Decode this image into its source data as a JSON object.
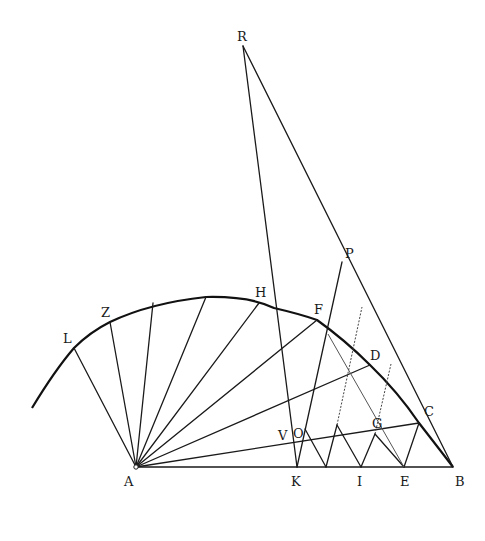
{
  "figure": {
    "type": "geometric construction"
  },
  "points": {
    "A": {
      "label": "A",
      "x": 136,
      "y": 467
    },
    "B": {
      "label": "B",
      "x": 453,
      "y": 467
    },
    "C": {
      "label": "C",
      "x": 419,
      "y": 423
    },
    "D": {
      "label": "D",
      "x": 370,
      "y": 365
    },
    "E": {
      "label": "E",
      "x": 404,
      "y": 467
    },
    "F": {
      "label": "F",
      "x": 317,
      "y": 320
    },
    "G": {
      "label": "G",
      "x": 375,
      "y": 434
    },
    "H": {
      "label": "H",
      "x": 259,
      "y": 303
    },
    "I": {
      "label": "I",
      "x": 361,
      "y": 467
    },
    "K": {
      "label": "K",
      "x": 297,
      "y": 467
    },
    "L": {
      "label": "L",
      "x": 74,
      "y": 348
    },
    "O": {
      "label": "O",
      "x": 305,
      "y": 429
    },
    "P": {
      "label": "P",
      "x": 342,
      "y": 262
    },
    "R": {
      "label": "R",
      "x": 243,
      "y": 46
    },
    "V": {
      "label": "V",
      "x": 292,
      "y": 432
    },
    "Z": {
      "label": "Z",
      "x": 110,
      "y": 322
    }
  },
  "labels": [
    {
      "text": "R",
      "x": 237,
      "y": 41
    },
    {
      "text": "P",
      "x": 345,
      "y": 258
    },
    {
      "text": "H",
      "x": 255,
      "y": 297
    },
    {
      "text": "F",
      "x": 314,
      "y": 314
    },
    {
      "text": "Z",
      "x": 101,
      "y": 317
    },
    {
      "text": "L",
      "x": 63,
      "y": 343
    },
    {
      "text": "D",
      "x": 370,
      "y": 360
    },
    {
      "text": "C",
      "x": 424,
      "y": 416
    },
    {
      "text": "G",
      "x": 372,
      "y": 428
    },
    {
      "text": "V",
      "x": 278,
      "y": 440
    },
    {
      "text": "O",
      "x": 293,
      "y": 438
    },
    {
      "text": "A",
      "x": 124,
      "y": 486
    },
    {
      "text": "K",
      "x": 291,
      "y": 486
    },
    {
      "text": "I",
      "x": 357,
      "y": 486
    },
    {
      "text": "E",
      "x": 400,
      "y": 486
    },
    {
      "text": "B",
      "x": 455,
      "y": 486
    }
  ],
  "colors": {
    "ink": "#1a1a1a",
    "background": "#ffffff"
  }
}
